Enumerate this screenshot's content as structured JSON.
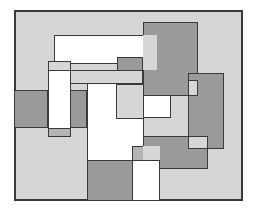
{
  "figure": {
    "colors": {
      "background": "#ffffff",
      "light": "#d6d6d6",
      "medium": "#b4b4b4",
      "dark": "#9a9a9a",
      "white": "#ffffff",
      "stroke": "#3a3a3a"
    },
    "rects": [
      {
        "id": "frame",
        "x": 14,
        "y": 10,
        "w": 229,
        "h": 191,
        "fill": "light",
        "border": 2
      },
      {
        "id": "dark-top-right",
        "x": 143,
        "y": 22,
        "w": 55,
        "h": 74,
        "fill": "dark",
        "border": 1
      },
      {
        "id": "white-top-bar",
        "x": 54,
        "y": 35,
        "w": 103,
        "h": 29,
        "fill": "white",
        "border": 1
      },
      {
        "id": "light-top-overlap",
        "x": 143,
        "y": 35,
        "w": 14,
        "h": 35,
        "fill": "light",
        "border": 0
      },
      {
        "id": "dark-mid-strip",
        "x": 117,
        "y": 57,
        "w": 26,
        "h": 14,
        "fill": "dark",
        "border": 1
      },
      {
        "id": "light-mid-band",
        "x": 70,
        "y": 70,
        "w": 73,
        "h": 14,
        "fill": "light",
        "border": 1
      },
      {
        "id": "left-white-top",
        "x": 48,
        "y": 61,
        "w": 23,
        "h": 10,
        "fill": "light",
        "border": 1
      },
      {
        "id": "left-dark",
        "x": 14,
        "y": 90,
        "w": 34,
        "h": 38,
        "fill": "dark",
        "border": 1
      },
      {
        "id": "left-white-column",
        "x": 48,
        "y": 70,
        "w": 23,
        "h": 67,
        "fill": "white",
        "border": 1
      },
      {
        "id": "left-white-bottom-tab",
        "x": 48,
        "y": 128,
        "w": 23,
        "h": 9,
        "fill": "medium",
        "border": 1
      },
      {
        "id": "mid-dark-small",
        "x": 70,
        "y": 90,
        "w": 17,
        "h": 38,
        "fill": "dark",
        "border": 1
      },
      {
        "id": "center-white-tall",
        "x": 87,
        "y": 83,
        "w": 57,
        "h": 118,
        "fill": "white",
        "border": 1
      },
      {
        "id": "right-dark",
        "x": 188,
        "y": 73,
        "w": 36,
        "h": 76,
        "fill": "dark",
        "border": 1
      },
      {
        "id": "center-light-box",
        "x": 116,
        "y": 84,
        "w": 28,
        "h": 35,
        "fill": "light",
        "border": 1
      },
      {
        "id": "white-right-box",
        "x": 143,
        "y": 95,
        "w": 28,
        "h": 23,
        "fill": "white",
        "border": 1
      },
      {
        "id": "right-light-notch",
        "x": 188,
        "y": 80,
        "w": 10,
        "h": 16,
        "fill": "light",
        "border": 1
      },
      {
        "id": "bottom-dark-center",
        "x": 143,
        "y": 136,
        "w": 65,
        "h": 33,
        "fill": "dark",
        "border": 1
      },
      {
        "id": "white-notch-right",
        "x": 188,
        "y": 136,
        "w": 20,
        "h": 13,
        "fill": "light",
        "border": 1
      },
      {
        "id": "bottom-medium-small",
        "x": 132,
        "y": 146,
        "w": 28,
        "h": 15,
        "fill": "medium",
        "border": 1
      },
      {
        "id": "bottom-light-strip",
        "x": 143,
        "y": 146,
        "w": 17,
        "h": 15,
        "fill": "light",
        "border": 0
      },
      {
        "id": "bottom-dark-left",
        "x": 87,
        "y": 160,
        "w": 46,
        "h": 41,
        "fill": "dark",
        "border": 1
      },
      {
        "id": "bottom-white-right",
        "x": 132,
        "y": 160,
        "w": 28,
        "h": 41,
        "fill": "white",
        "border": 1
      }
    ]
  }
}
